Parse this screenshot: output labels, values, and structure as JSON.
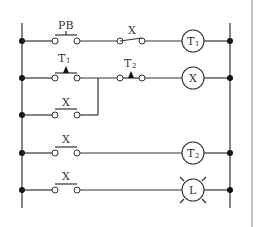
{
  "diagram": {
    "type": "ladder-diagram",
    "rungs": [
      {
        "contacts": [
          {
            "label": "PB",
            "kind": "normally-open-pushbutton"
          },
          {
            "label": "X",
            "kind": "normally-open"
          }
        ],
        "output": {
          "label": "T",
          "sub": "1",
          "kind": "coil"
        }
      },
      {
        "contacts": [
          {
            "label": "T",
            "sub": "1",
            "kind": "timer-normally-open"
          },
          {
            "label": "T",
            "sub": "2",
            "kind": "timer-normally-closed"
          }
        ],
        "output": {
          "label": "X",
          "kind": "coil"
        }
      },
      {
        "contacts": [
          {
            "label": "X",
            "kind": "normally-open",
            "parallel_branch_of": 1
          }
        ]
      },
      {
        "contacts": [
          {
            "label": "X",
            "kind": "normally-open"
          }
        ],
        "output": {
          "label": "T",
          "sub": "2",
          "kind": "coil"
        }
      },
      {
        "contacts": [
          {
            "label": "X",
            "kind": "normally-open"
          }
        ],
        "output": {
          "label": "L",
          "kind": "lamp"
        }
      }
    ]
  },
  "labels": {
    "pb": "PB",
    "x1": "X",
    "t1_coil": "T",
    "t1_coil_sub": "1",
    "t1_contact": "T",
    "t1_contact_sub": "1",
    "t2_contact": "T",
    "t2_contact_sub": "2",
    "x_coil": "X",
    "x_branch": "X",
    "x3": "X",
    "t2_coil": "T",
    "t2_coil_sub": "2",
    "x4": "X",
    "lamp": "L"
  }
}
